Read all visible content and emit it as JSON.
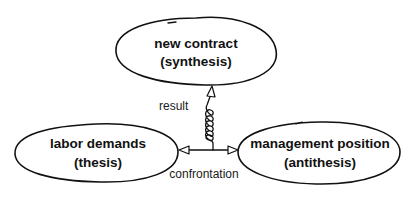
{
  "diagram": {
    "type": "dialectic-concept-diagram",
    "nodes": [
      {
        "id": "synthesis",
        "line1": "new contract",
        "line2": "(synthesis)",
        "position": "top-center"
      },
      {
        "id": "thesis",
        "line1": "labor demands",
        "line2": "(thesis)",
        "position": "bottom-left"
      },
      {
        "id": "antithesis",
        "line1": "management position",
        "line2": "(antithesis)",
        "position": "bottom-right"
      }
    ],
    "edges": [
      {
        "id": "confrontation",
        "label": "confrontation",
        "from": "thesis",
        "to": "antithesis",
        "style": "double-headed straight arrow"
      },
      {
        "id": "result",
        "label": "result",
        "from": "confrontation",
        "to": "synthesis",
        "style": "coiled spring arrow"
      }
    ],
    "colors": {
      "stroke": "#111111",
      "background": "#ffffff",
      "text": "#111111"
    }
  }
}
